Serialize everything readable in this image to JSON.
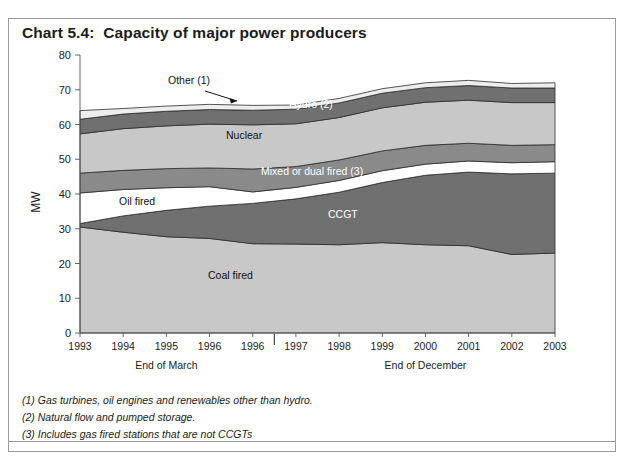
{
  "title": "Chart 5.4:  Capacity of major power producers",
  "notes": [
    "(1) Gas turbines, oil engines and renewables other than hydro.",
    "(2) Natural flow and pumped storage.",
    "(3) Includes gas fired stations that are not CCGTs"
  ],
  "axis": {
    "ylabel": "MW",
    "yticks": [
      "0",
      "10",
      "20",
      "30",
      "40",
      "50",
      "60",
      "70",
      "80"
    ],
    "group_labels": [
      "End of March",
      "End of December"
    ]
  },
  "chart_data": {
    "type": "area",
    "title": "Chart 5.4:  Capacity of major power producers",
    "xlabel": "",
    "ylabel": "MW",
    "ylim": [
      0,
      80
    ],
    "ytick_step": 10,
    "grid": false,
    "legend": "inline-labels",
    "stacked": true,
    "categories": [
      "1993",
      "1994",
      "1995",
      "1996",
      "1996",
      "1997",
      "1998",
      "1999",
      "2000",
      "2001",
      "2002",
      "2003"
    ],
    "group_labels": [
      {
        "label": "End of March",
        "categories": [
          "1993",
          "1994",
          "1995",
          "1996",
          "1996"
        ]
      },
      {
        "label": "End of December",
        "categories": [
          "1997",
          "1998",
          "1999",
          "2000",
          "2001",
          "2002",
          "2003"
        ]
      }
    ],
    "series": [
      {
        "name": "Coal fired",
        "color": "#c8c8c8",
        "values": [
          30.5,
          29.0,
          27.7,
          27.2,
          25.7,
          25.6,
          25.4,
          26.0,
          25.4,
          25.1,
          22.6,
          23.0
        ]
      },
      {
        "name": "CCGT",
        "color": "#707070",
        "values": [
          1.0,
          4.7,
          7.6,
          9.3,
          11.6,
          13.0,
          15.1,
          17.3,
          20.0,
          21.2,
          23.2,
          23.0
        ]
      },
      {
        "name": "Oil fired",
        "color": "#ffffff",
        "values": [
          8.8,
          7.6,
          6.5,
          5.6,
          3.3,
          3.3,
          3.4,
          3.4,
          3.2,
          3.2,
          3.2,
          3.3
        ]
      },
      {
        "name": "Mixed or dual fired (3)",
        "color": "#8a8a8a",
        "values": [
          5.7,
          5.5,
          5.5,
          5.4,
          6.6,
          6.0,
          5.9,
          5.7,
          5.4,
          5.1,
          5.0,
          4.9
        ]
      },
      {
        "name": "Nuclear",
        "color": "#c8c8c8",
        "values": [
          11.3,
          12.0,
          12.3,
          12.6,
          12.7,
          12.3,
          12.2,
          12.4,
          12.4,
          12.4,
          12.3,
          12.1
        ]
      },
      {
        "name": "Hydro (2)",
        "color": "#707070",
        "values": [
          4.2,
          4.2,
          4.2,
          4.2,
          4.2,
          4.2,
          4.2,
          4.2,
          4.2,
          4.2,
          4.2,
          4.2
        ]
      },
      {
        "name": "Other (1)",
        "color": "#ededed",
        "values": [
          2.5,
          1.6,
          1.5,
          1.5,
          1.4,
          1.2,
          1.3,
          1.3,
          1.4,
          1.5,
          1.3,
          1.5
        ]
      }
    ],
    "cumulative_tops": {
      "Coal fired": [
        30.5,
        29.0,
        27.7,
        27.2,
        25.7,
        25.6,
        25.4,
        26.0,
        25.4,
        25.1,
        22.6,
        23.0
      ],
      "CCGT": [
        31.5,
        33.7,
        35.3,
        36.5,
        37.3,
        38.6,
        40.5,
        43.3,
        45.4,
        46.3,
        45.8,
        46.0
      ],
      "Oil fired": [
        40.3,
        41.3,
        41.8,
        42.1,
        40.6,
        41.9,
        43.9,
        46.7,
        48.6,
        49.5,
        49.0,
        49.3
      ],
      "Mixed or dual fired (3)": [
        46.0,
        46.8,
        47.3,
        47.5,
        47.2,
        47.9,
        49.8,
        52.4,
        54.0,
        54.6,
        54.0,
        54.2
      ],
      "Nuclear": [
        57.3,
        58.8,
        59.6,
        60.1,
        59.9,
        60.2,
        62.0,
        64.8,
        66.4,
        67.0,
        66.3,
        66.3
      ],
      "Hydro (2)": [
        61.5,
        63.0,
        63.8,
        64.3,
        64.1,
        64.4,
        66.2,
        69.0,
        70.6,
        71.2,
        70.5,
        70.5
      ],
      "Other (1)": [
        64.0,
        64.6,
        65.3,
        65.8,
        65.5,
        65.6,
        67.5,
        70.3,
        72.0,
        72.7,
        71.8,
        72.0
      ]
    },
    "annotations": [
      {
        "text": "Other (1)",
        "type": "leader-label"
      },
      {
        "text": "Hydro (2)",
        "type": "inline-label"
      },
      {
        "text": "Nuclear",
        "type": "inline-label"
      },
      {
        "text": "Mixed or dual fired (3)",
        "type": "inline-label"
      },
      {
        "text": "Oil fired",
        "type": "inline-label"
      },
      {
        "text": "CCGT",
        "type": "inline-label"
      },
      {
        "text": "Coal fired",
        "type": "inline-label"
      }
    ]
  }
}
